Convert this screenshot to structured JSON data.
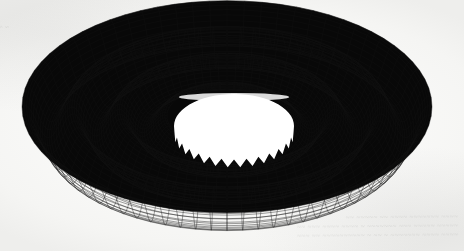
{
  "page": {
    "background_color": "#fbfbfa",
    "media": "scanned-paper",
    "ghost_text_top_left": "~ ~~ ~~~~~",
    "ghost_text_bottom_right_line1": "~~ ~~~~~ ~~ ~~~~ ~~~~~~~ ~~~~",
    "ghost_text_bottom_right_line2": "~~ ~~~ ~~~~ ~~~~ ~ ~~~~~~~ ~~~ ~~~~~ ~~~~~",
    "ghost_text_bottom_right_line3": "~~~ ~~ ~~~~~~~~~~ ~ ~~ ~ ~~~~~~~ ~~~~ ~~~~"
  },
  "figure": {
    "name": "mesh-surface-plot",
    "line_color": "#111111",
    "fill_color": "#000000",
    "hole_color": "#ffffff",
    "bounds": {
      "left": 22,
      "top": 16,
      "right": 432,
      "bottom": 228
    }
  },
  "chart_data": {
    "type": "surface",
    "title": "",
    "subtitle": "",
    "xlabel": "",
    "ylabel": "",
    "zlabel": "",
    "projection": "3d-wireframe-mesh",
    "grid": true,
    "legend": false,
    "axes_visible": false,
    "tick_labels": [],
    "annotations": [],
    "surface": {
      "function": "radially symmetric damped oscillation z = A*cos(k*r)/r-like ripple",
      "coordinate_system": "polar",
      "domain": {
        "r_min": 1.0,
        "r_max": 6.0,
        "theta_min": 0,
        "theta_max": 6.2832
      },
      "grid_divisions": {
        "radial": 64,
        "angular": 72
      },
      "ripple_rings": 6,
      "amplitude_decay": "increasing outward then damped",
      "view": {
        "azimuth_deg": -37,
        "elevation_deg": 22
      }
    },
    "geometry": {
      "outer_ellipse": {
        "cx": 227,
        "cy": 122,
        "rx": 205,
        "ry": 106
      },
      "inner_hole_ellipse": {
        "cx": 234,
        "cy": 126,
        "rx": 60,
        "ry": 32
      },
      "scallops_outer": 72,
      "teeth_inner": 60
    },
    "x": [
      1.0,
      1.4,
      1.8,
      2.2,
      2.6,
      3.0,
      3.4,
      3.8,
      4.2,
      4.6,
      5.0,
      5.4,
      5.8,
      6.0
    ],
    "values": [
      0.95,
      -0.72,
      0.62,
      -0.55,
      0.5,
      -0.46,
      0.43,
      -0.4,
      0.38,
      -0.36,
      0.34,
      -0.32,
      0.3,
      0.28
    ],
    "zlim": [
      -1.0,
      1.0
    ]
  }
}
